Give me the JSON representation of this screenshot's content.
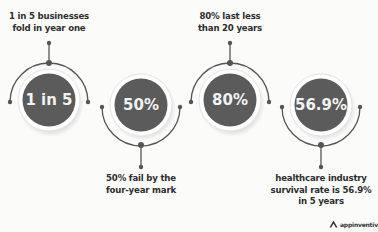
{
  "stats": [
    {
      "value": "1 in 5",
      "caption_lines": [
        "1 in 5 businesses",
        "fold in year one"
      ],
      "position": "top"
    },
    {
      "value": "50%",
      "caption_lines": [
        "50% fail by the",
        "four-year mark"
      ],
      "position": "bottom"
    },
    {
      "value": "80%",
      "caption_lines": [
        "80% last less",
        "than 20 years"
      ],
      "position": "top"
    },
    {
      "value": "56.9%",
      "caption_lines": [
        "healthcare industry",
        "survival rate is 56.9%",
        "in 5 years"
      ],
      "position": "bottom"
    }
  ],
  "brand": {
    "name": "appinventiv",
    "icon": "triangle-a-logo-icon"
  },
  "colors": {
    "circle_fill": "#5b5b5b",
    "arc": "#555555",
    "text": "#2e2e2e",
    "background": "#fbfbfa"
  }
}
